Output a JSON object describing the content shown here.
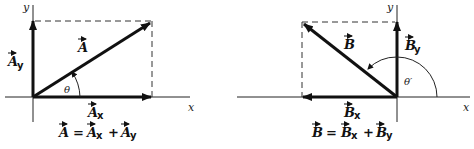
{
  "diagrams": [
    {
      "id": "A",
      "axis_x_label": "x",
      "axis_y_label": "y",
      "vector_label": "A",
      "x_component_label": "A",
      "x_component_sub": "x",
      "y_component_label": "A",
      "y_component_sub": "y",
      "angle_label": "θ",
      "equation": {
        "lhs": "A",
        "eq": "=",
        "t1": "A",
        "t1_sub": "x",
        "plus": "+",
        "t2": "A",
        "t2_sub": "y"
      }
    },
    {
      "id": "B",
      "axis_x_label": "x",
      "axis_y_label": "y",
      "vector_label": "B",
      "x_component_label": "B",
      "x_component_sub": "x",
      "y_component_label": "B",
      "y_component_sub": "y",
      "angle_label": "θ′",
      "equation": {
        "lhs": "B",
        "eq": "=",
        "t1": "B",
        "t1_sub": "x",
        "plus": "+",
        "t2": "B",
        "t2_sub": "y"
      }
    }
  ],
  "colors": {
    "ink": "#111111",
    "background": "#ffffff"
  }
}
